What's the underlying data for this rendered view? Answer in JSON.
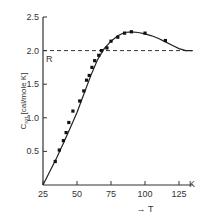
{
  "chart_data": {
    "type": "line",
    "title": "",
    "xlabel": "→ T",
    "x_unit": "K",
    "ylabel": "C_rot [cal/mole K]",
    "ylabel_main": "C",
    "ylabel_sub": "rot",
    "ylabel_rest": " [cal/mole K]",
    "xlim": [
      25,
      135
    ],
    "ylim": [
      0,
      2.5
    ],
    "x_ticks": [
      25,
      50,
      75,
      100,
      125
    ],
    "x_tick_labels": [
      "25",
      "50",
      "75",
      "100",
      "125"
    ],
    "y_ticks": [
      0.5,
      1.0,
      1.5,
      2.0,
      2.5
    ],
    "y_tick_labels": [
      "0.5",
      "1.0",
      "1.5",
      "2.0",
      "2.5"
    ],
    "grid": false,
    "reference_line": {
      "y": 2.0,
      "label": "R",
      "style": "dashed"
    },
    "series": [
      {
        "name": "measured",
        "x": [
          34,
          37,
          40,
          42,
          44,
          47,
          52,
          55,
          57,
          59,
          61,
          63,
          66,
          68,
          72,
          75,
          80,
          85,
          90,
          100,
          115
        ],
        "values": [
          0.35,
          0.52,
          0.66,
          0.78,
          0.93,
          1.1,
          1.25,
          1.4,
          1.56,
          1.63,
          1.75,
          1.85,
          1.93,
          2.0,
          2.04,
          2.14,
          2.2,
          2.26,
          2.28,
          2.26,
          2.15
        ]
      },
      {
        "name": "theory_curve",
        "x": [
          25,
          30,
          35,
          40,
          45,
          50,
          55,
          60,
          65,
          70,
          75,
          80,
          85,
          90,
          95,
          100,
          105,
          110,
          115,
          120,
          125,
          130,
          135
        ],
        "values": [
          0.0,
          0.2,
          0.4,
          0.62,
          0.85,
          1.08,
          1.35,
          1.62,
          1.86,
          2.03,
          2.14,
          2.22,
          2.27,
          2.28,
          2.27,
          2.25,
          2.22,
          2.18,
          2.13,
          2.08,
          2.03,
          2.0,
          2.0
        ]
      }
    ]
  }
}
